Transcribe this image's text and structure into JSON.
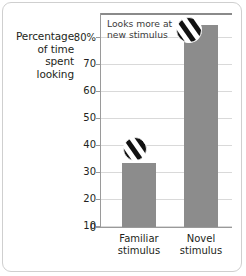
{
  "figure": {
    "y_caption_lines": [
      "Percentage",
      "of time",
      "spent",
      "looking"
    ],
    "annotation_lines": [
      "Looks more at",
      "new stimulus"
    ],
    "icon_name": "striped-circle-icon",
    "bar_color": "#8c8c8c",
    "gridline_color": "#d9d9d9",
    "axis_color": "#9a9a9a",
    "frame_color": "#cfcfcf",
    "text_color": "#231f20"
  },
  "chart_data": {
    "type": "bar",
    "title": "",
    "xlabel": "",
    "ylabel": "Percentage of time spent looking",
    "categories": [
      "Familiar stimulus",
      "Novel stimulus"
    ],
    "category_lines": [
      [
        "Familiar",
        "stimulus"
      ],
      [
        "Novel",
        "stimulus"
      ]
    ],
    "values": [
      24,
      75
    ],
    "ylim": [
      0,
      80
    ],
    "ytick_labels": [
      "80%",
      "70",
      "60",
      "50",
      "40",
      "30",
      "20",
      "10",
      "0"
    ],
    "ytick_values": [
      80,
      70,
      60,
      50,
      40,
      30,
      20,
      10,
      0
    ],
    "grid": true,
    "legend": "none",
    "annotations": [
      {
        "text": "Looks more at new stimulus",
        "target_category": "Novel stimulus"
      }
    ]
  }
}
